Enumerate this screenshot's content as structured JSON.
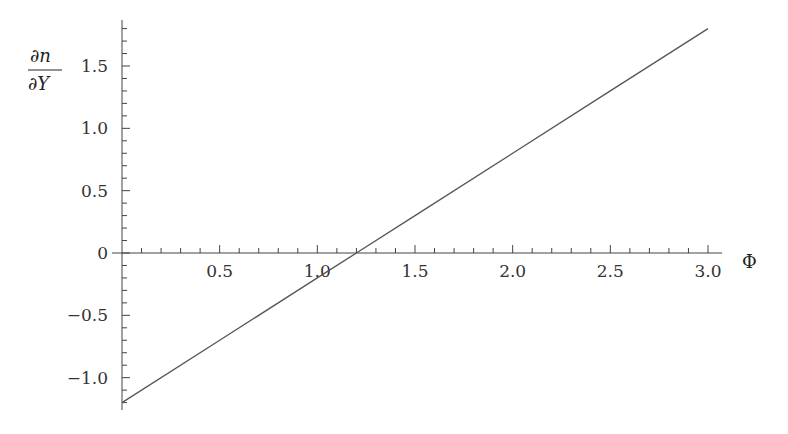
{
  "chart_data": {
    "type": "line",
    "title": "",
    "xlabel": "Φ",
    "ylabel": "∂n/∂Y",
    "ylabel_numerator": "∂n",
    "ylabel_denominator": "∂Y",
    "xlim": [
      0,
      3.0
    ],
    "ylim": [
      -1.2,
      1.85
    ],
    "x_ticks": [
      0.5,
      1.0,
      1.5,
      2.0,
      2.5,
      3.0
    ],
    "x_tick_labels": [
      "0.5",
      "1.0",
      "1.5",
      "2.0",
      "2.5",
      "3.0"
    ],
    "y_ticks": [
      -1.0,
      -0.5,
      0,
      0.5,
      1.0,
      1.5
    ],
    "y_tick_labels": [
      "−1.0",
      "−0.5",
      "0",
      "0.5",
      "1.0",
      "1.5"
    ],
    "grid": false,
    "legend": null,
    "series": [
      {
        "name": "∂n/∂Y",
        "x": [
          0,
          0.5,
          1.0,
          1.2,
          1.5,
          2.0,
          2.5,
          3.0
        ],
        "y": [
          -1.2,
          -0.7,
          -0.2,
          0.0,
          0.3,
          0.8,
          1.3,
          1.8
        ],
        "color": "#555555"
      }
    ],
    "annotations": [
      "zero crossing near Φ ≈ 1.2"
    ]
  }
}
